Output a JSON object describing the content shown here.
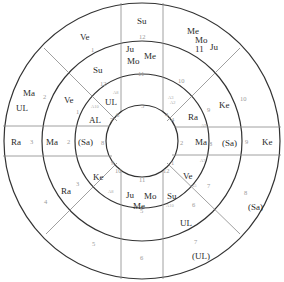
{
  "chart": {
    "type": "concentric-astrology-wheel",
    "center": [
      142,
      141
    ],
    "radii": {
      "core": 36,
      "inner": 67,
      "middle": 100,
      "outer": 138
    },
    "line_color": "#333333",
    "divider_color": "#888888",
    "number_color": "#9a9a9a"
  },
  "inner_ring": {
    "numbers": [
      {
        "id": "n5",
        "text": "5"
      },
      {
        "id": "n4a",
        "text": "4"
      },
      {
        "id": "n4b",
        "text": "4"
      },
      {
        "id": "n2",
        "text": "2"
      },
      {
        "id": "n1",
        "text": "1"
      },
      {
        "id": "n12",
        "text": "12"
      },
      {
        "id": "n11",
        "text": "11"
      },
      {
        "id": "n10",
        "text": "10"
      },
      {
        "id": "n9",
        "text": "9"
      },
      {
        "id": "n8",
        "text": "8"
      },
      {
        "id": "n7",
        "text": "7"
      },
      {
        "id": "n6",
        "text": "6"
      }
    ],
    "cells": {
      "top_left_upper": {
        "planets": [
          "UL"
        ],
        "sub": "A8"
      },
      "top_left_lower": {
        "planets": [
          "AL"
        ],
        "sub": "A10"
      },
      "top_right_upper": {
        "sub1": "A3",
        "sub2": "A2"
      },
      "top_right_lower": {
        "planets": [
          "Ra"
        ],
        "sub": "A9"
      },
      "left": {
        "planets": [
          "(Sa)"
        ]
      },
      "right": {
        "planets": [
          "Ma"
        ],
        "sub": "A7"
      },
      "bottom_left": {
        "planets": [
          "Ke"
        ],
        "sub": "A8"
      },
      "bottom_center": {
        "planets": [
          "Ju",
          "Mo",
          "Me"
        ]
      },
      "bottom_right_upper": {
        "planets": [
          "Ve"
        ],
        "sub": "A5"
      },
      "bottom_right_lower": {
        "planets": [
          "Su"
        ],
        "sub": "A10"
      }
    }
  },
  "middle_ring": {
    "top": {
      "planets": [
        "Ju",
        "Mo",
        "Me"
      ],
      "num": "11"
    },
    "top_left": {
      "planets": [
        "Su"
      ],
      "num": "12"
    },
    "left_upper": {
      "planets": [
        "Ve"
      ],
      "num": "1"
    },
    "left": {
      "planets": [
        "Ma"
      ],
      "num": "2"
    },
    "bottom_left": {
      "planets": [
        "Ra"
      ],
      "num": "3"
    },
    "bottom": {
      "num": "5"
    },
    "bottom_right": {
      "planets": [
        "UL"
      ],
      "num": "6"
    },
    "right_lower": {
      "num": "7"
    },
    "right": {
      "planets": [
        "(Sa)"
      ],
      "num": "8"
    },
    "top_right": {
      "planets": [
        "Ke"
      ],
      "num": "9"
    },
    "top_right_upper": {
      "num": "10"
    }
  },
  "outer_ring": {
    "top": {
      "planets": [
        "Su"
      ],
      "num": "12"
    },
    "top_right": {
      "planets": [
        "Me",
        "Mo",
        "Ju",
        "11"
      ]
    },
    "right_upper": {
      "num": "10"
    },
    "right": {
      "planets": [
        "Ke"
      ],
      "num": "9"
    },
    "bottom_right": {
      "planets": [
        "(Sa)"
      ],
      "num": "8"
    },
    "bottom_right_lower": {
      "planets": [
        "(UL)"
      ],
      "num": "7"
    },
    "bottom": {
      "num": "6"
    },
    "bottom_left": {
      "num": "5"
    },
    "left_lower": {
      "num": "4"
    },
    "left": {
      "planets": [
        "Ra"
      ],
      "num": "3"
    },
    "left_upper": {
      "planets": [
        "Ma",
        "UL"
      ],
      "num": "2"
    },
    "top_left": {
      "planets": [
        "Ve"
      ],
      "num": "1"
    }
  }
}
